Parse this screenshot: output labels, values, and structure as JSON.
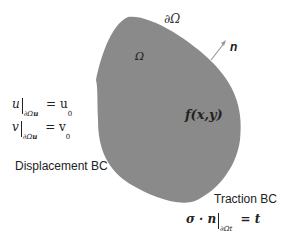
{
  "diagram": {
    "type": "domain-boundary-conditions",
    "colors": {
      "domain_fill": "#8a8a8a",
      "arrow": "#9a9a9a",
      "text": "#1a1a1a",
      "background": "#ffffff"
    },
    "domain": {
      "label": "Ω",
      "boundary_label": "∂Ω",
      "body_force_label": "f(x,y)",
      "normal_label": "n"
    },
    "displacement_bc": {
      "title": "Displacement BC",
      "eq_u": {
        "lhs": "u",
        "subscript": "∂Ω",
        "sub_index": "u",
        "rhs": "= u",
        "rhs_sub": "0"
      },
      "eq_v": {
        "lhs": "v",
        "subscript": "∂Ω",
        "sub_index": "u",
        "rhs": "= v",
        "rhs_sub": "0"
      }
    },
    "traction_bc": {
      "title": "Traction BC",
      "eq": {
        "lhs": "σ · n",
        "subscript": "∂Ω",
        "sub_index": "t",
        "rhs": "= t"
      }
    }
  }
}
